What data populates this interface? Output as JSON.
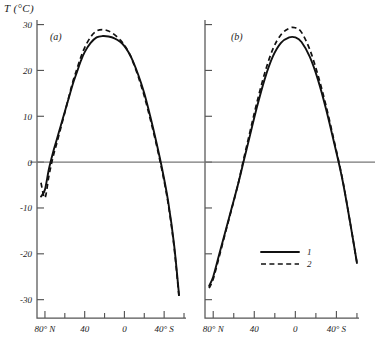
{
  "figure": {
    "y_axis_label": "T (°C)",
    "panels": [
      {
        "key": "a",
        "label": "(a)"
      },
      {
        "key": "b",
        "label": "(b)"
      }
    ],
    "legend": {
      "entries": [
        {
          "id": "1",
          "label": "1",
          "style": "solid"
        },
        {
          "id": "2",
          "label": "2",
          "style": "dashed"
        }
      ]
    }
  },
  "axes": {
    "y_ticks": [
      "30",
      "20",
      "10",
      "0",
      "-10",
      "-20",
      "-30"
    ],
    "y_tick_values": [
      30,
      20,
      10,
      0,
      -10,
      -20,
      -30
    ],
    "x_ticks_labeled": [
      "80° N",
      "40",
      "0",
      "40° S"
    ],
    "x_tick_values_labeled": [
      80,
      40,
      0,
      -40
    ],
    "x_minor_values": [
      60,
      20,
      -20,
      -60
    ],
    "ylim": [
      -34,
      31
    ],
    "xlim": [
      88,
      -62
    ]
  },
  "chart_data": {
    "type": "line",
    "title": "",
    "xlabel": "",
    "ylabel": "T (°C)",
    "ylim": [
      -34,
      31
    ],
    "xlim": [
      88,
      -62
    ],
    "grid": false,
    "legend_position": "lower-right-of-panel-b",
    "zero_reference_line": 0,
    "panels": [
      {
        "name": "(a)",
        "series": [
          {
            "name": "1",
            "style": "solid",
            "x": [
              84,
              80,
              76,
              72,
              68,
              64,
              60,
              56,
              52,
              48,
              44,
              40,
              34,
              28,
              22,
              16,
              10,
              4,
              0,
              -4,
              -8,
              -14,
              -20,
              -26,
              -32,
              -38,
              -44,
              -50,
              -55
            ],
            "y": [
              -7.5,
              -6.0,
              -1.5,
              2.0,
              5.0,
              8.0,
              11.0,
              14.0,
              17.0,
              19.5,
              22.0,
              24.0,
              26.0,
              27.2,
              27.5,
              27.4,
              27.0,
              26.2,
              25.3,
              24.0,
              22.3,
              19.0,
              15.0,
              10.0,
              4.5,
              -1.5,
              -8.5,
              -18.0,
              -29.0
            ]
          },
          {
            "name": "2",
            "style": "dashed",
            "x": [
              84,
              80,
              76,
              72,
              68,
              64,
              60,
              56,
              52,
              48,
              44,
              40,
              34,
              28,
              22,
              16,
              10,
              4,
              0,
              -4,
              -8,
              -14,
              -20,
              -26,
              -32,
              -38,
              -44,
              -50,
              -55
            ],
            "y": [
              -4.5,
              -7.8,
              -3.0,
              1.0,
              4.2,
              7.5,
              10.8,
              14.2,
              17.5,
              20.2,
              22.8,
              25.0,
              27.3,
              28.6,
              28.9,
              28.6,
              27.8,
              26.6,
              25.5,
              24.1,
              22.2,
              18.6,
              14.4,
              9.4,
              4.0,
              -2.0,
              -9.0,
              -18.5,
              -29.5
            ]
          }
        ]
      },
      {
        "name": "(b)",
        "series": [
          {
            "name": "1",
            "style": "solid",
            "x": [
              84,
              80,
              74,
              68,
              62,
              56,
              50,
              44,
              38,
              30,
              22,
              14,
              6,
              0,
              -6,
              -14,
              -22,
              -30,
              -38,
              -46,
              -54,
              -60
            ],
            "y": [
              -27.0,
              -25.0,
              -20.0,
              -15.0,
              -10.0,
              -5.0,
              0.5,
              6.0,
              11.5,
              18.0,
              23.0,
              26.0,
              27.2,
              27.2,
              26.2,
              23.0,
              18.0,
              11.5,
              4.0,
              -4.0,
              -14.0,
              -22.0
            ]
          },
          {
            "name": "2",
            "style": "dashed",
            "x": [
              84,
              80,
              74,
              68,
              62,
              56,
              50,
              44,
              38,
              30,
              22,
              14,
              6,
              0,
              -6,
              -14,
              -22,
              -30,
              -38,
              -46,
              -54,
              -60
            ],
            "y": [
              -27.5,
              -25.5,
              -20.5,
              -15.3,
              -10.2,
              -5.0,
              1.0,
              6.8,
              12.5,
              19.3,
              24.6,
              27.8,
              29.2,
              29.3,
              28.3,
              24.6,
              19.0,
              12.2,
              4.4,
              -3.8,
              -14.0,
              -22.0
            ]
          }
        ]
      }
    ]
  }
}
